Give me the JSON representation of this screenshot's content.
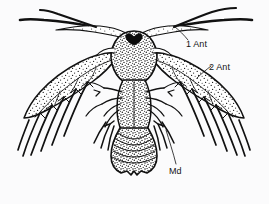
{
  "figure": {
    "kind": "scientific-line-drawing",
    "background_color": "#fbfbfc",
    "ink_color": "#111111",
    "stipple_color": "#1a1a1a",
    "width": 269,
    "height": 204
  },
  "labels": {
    "first_antenna": "1 Ant",
    "second_antenna": "2 Ant",
    "mandible": "Md"
  },
  "label_names": {
    "first_antenna": "first-antenna-label",
    "second_antenna": "second-antenna-label",
    "mandible": "mandible-label"
  },
  "anatomy": {
    "eye": "median eye",
    "carapace": "cephalic shield",
    "abdomen": "segmented abdomen",
    "telson": "notched telson",
    "setae": "plumose natatory setae"
  },
  "leader_lines": [
    {
      "name": "leader-1-ant",
      "from": [
        187,
        41
      ],
      "to": [
        175,
        27
      ]
    },
    {
      "name": "leader-2-ant",
      "from": [
        210,
        65
      ],
      "to": [
        196,
        77
      ]
    },
    {
      "name": "leader-md",
      "from": [
        176,
        165
      ],
      "to": [
        165,
        130
      ]
    }
  ]
}
